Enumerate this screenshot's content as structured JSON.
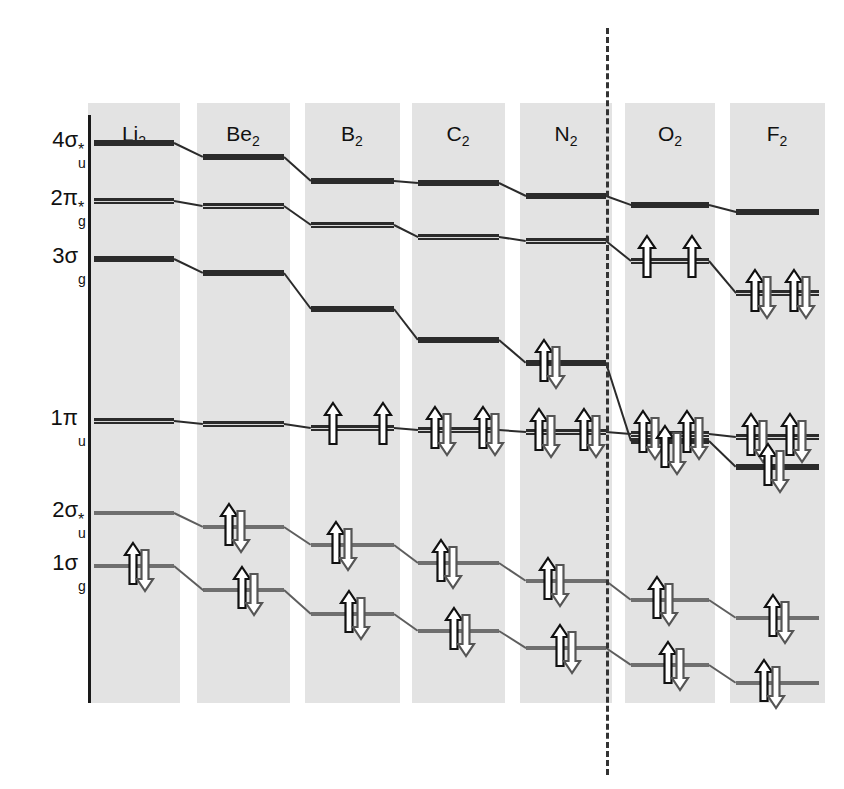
{
  "figure": {
    "type": "molecular-orbital-correlation-diagram",
    "title": "",
    "background_band_color": "#e3e3e3",
    "line_color": "#2b2b2b",
    "divider": {
      "kind": "dashed-vertical",
      "x": 606,
      "note": "separates N2 from O2 where 3-sigma-g and 1-pi-u orbital ordering inverts"
    }
  },
  "axis": {
    "orbital_labels": [
      {
        "id": "4su",
        "base": "4σ",
        "star": "*",
        "sub": "u",
        "y": 143
      },
      {
        "id": "2pg",
        "base": "2π",
        "star": "*",
        "sub": "g",
        "y": 201
      },
      {
        "id": "3sg",
        "base": "3σ",
        "star": "",
        "sub": "g",
        "y": 259
      },
      {
        "id": "1pu",
        "base": "1π",
        "star": "",
        "sub": "u",
        "y": 421
      },
      {
        "id": "2su",
        "base": "2σ",
        "star": "*",
        "sub": "u",
        "y": 513
      },
      {
        "id": "1sg",
        "base": "1σ",
        "star": "",
        "sub": "g",
        "y": 566
      }
    ]
  },
  "columns": [
    {
      "id": "Li2",
      "element": "Li",
      "count": "2",
      "x": 88,
      "width": 92,
      "center": 134
    },
    {
      "id": "Be2",
      "element": "Be",
      "count": "2",
      "x": 197,
      "width": 93,
      "center": 243
    },
    {
      "id": "B2",
      "element": "B",
      "count": "2",
      "x": 305,
      "width": 95,
      "center": 352
    },
    {
      "id": "C2",
      "element": "C",
      "count": "2",
      "x": 412,
      "width": 93,
      "center": 458
    },
    {
      "id": "N2",
      "element": "N",
      "count": "2",
      "x": 520,
      "width": 92,
      "center": 566
    },
    {
      "id": "O2",
      "element": "O",
      "count": "2",
      "x": 625,
      "width": 90,
      "center": 670
    },
    {
      "id": "F2",
      "element": "F",
      "count": "2",
      "x": 730,
      "width": 95,
      "center": 777
    }
  ],
  "header_y": 122,
  "chart_data": {
    "type": "line",
    "xlabel": "",
    "ylabel": "Orbital energy (increasing upward)",
    "categories": [
      "Li2",
      "Be2",
      "B2",
      "C2",
      "N2",
      "O2",
      "F2"
    ],
    "grid": false,
    "legend": "none",
    "note": "y values are screen pixel rows (smaller = higher energy); electrons given as arrow counts per degenerate component",
    "series": [
      {
        "name": "4σ*u",
        "style": "thick",
        "values": [
          143,
          157,
          181,
          183,
          196,
          205,
          212
        ]
      },
      {
        "name": "2π*g",
        "style": "double",
        "values": [
          201,
          206,
          225,
          237,
          241,
          261,
          293
        ]
      },
      {
        "name": "3σg",
        "style": "thick",
        "values": [
          259,
          273,
          309,
          340,
          363,
          441,
          467
        ]
      },
      {
        "name": "1πu",
        "style": "double",
        "values": [
          421,
          424,
          428,
          430,
          432,
          434,
          437
        ]
      },
      {
        "name": "2σ*u",
        "style": "thin",
        "values": [
          513,
          527,
          545,
          563,
          581,
          600,
          618
        ]
      },
      {
        "name": "1σg",
        "style": "thin",
        "values": [
          566,
          590,
          614,
          631,
          648,
          665,
          683
        ]
      }
    ],
    "electron_occupancy": {
      "Li2": {
        "1σg": 2,
        "2σ*u": 0,
        "1πu": 0,
        "3σg": 0,
        "2π*g": 0,
        "4σ*u": 0
      },
      "Be2": {
        "1σg": 2,
        "2σ*u": 2,
        "1πu": 0,
        "3σg": 0,
        "2π*g": 0,
        "4σ*u": 0
      },
      "B2": {
        "1σg": 2,
        "2σ*u": 2,
        "1πu": 2,
        "3σg": 0,
        "2π*g": 0,
        "4σ*u": 0
      },
      "C2": {
        "1σg": 2,
        "2σ*u": 2,
        "1πu": 4,
        "3σg": 0,
        "2π*g": 0,
        "4σ*u": 0
      },
      "N2": {
        "1σg": 2,
        "2σ*u": 2,
        "1πu": 4,
        "3σg": 2,
        "2π*g": 0,
        "4σ*u": 0
      },
      "O2": {
        "1σg": 2,
        "2σ*u": 2,
        "3σg": 2,
        "1πu": 4,
        "2π*g": 2,
        "4σ*u": 0
      },
      "F2": {
        "1σg": 2,
        "2σ*u": 2,
        "3σg": 2,
        "1πu": 4,
        "2π*g": 4,
        "4σ*u": 0
      }
    }
  },
  "electrons": [
    {
      "col": "Li2",
      "orbital": "1σg",
      "x": 122,
      "y": 566,
      "kind": "pair"
    },
    {
      "col": "Be2",
      "orbital": "2σ*u",
      "x": 218,
      "y": 527,
      "kind": "pair"
    },
    {
      "col": "Be2",
      "orbital": "1σg",
      "x": 231,
      "y": 590,
      "kind": "pair"
    },
    {
      "col": "B2",
      "orbital": "1πu",
      "x": 322,
      "y": 428,
      "kind": "up"
    },
    {
      "col": "B2",
      "orbital": "1πu",
      "x": 372,
      "y": 428,
      "kind": "up"
    },
    {
      "col": "B2",
      "orbital": "2σ*u",
      "x": 325,
      "y": 545,
      "kind": "pair"
    },
    {
      "col": "B2",
      "orbital": "1σg",
      "x": 338,
      "y": 614,
      "kind": "pair"
    },
    {
      "col": "C2",
      "orbital": "1πu",
      "x": 424,
      "y": 430,
      "kind": "pair"
    },
    {
      "col": "C2",
      "orbital": "1πu",
      "x": 472,
      "y": 430,
      "kind": "pair"
    },
    {
      "col": "C2",
      "orbital": "2σ*u",
      "x": 430,
      "y": 563,
      "kind": "pair"
    },
    {
      "col": "C2",
      "orbital": "1σg",
      "x": 443,
      "y": 631,
      "kind": "pair"
    },
    {
      "col": "N2",
      "orbital": "3σg",
      "x": 533,
      "y": 363,
      "kind": "pair"
    },
    {
      "col": "N2",
      "orbital": "1πu",
      "x": 528,
      "y": 432,
      "kind": "pair"
    },
    {
      "col": "N2",
      "orbital": "1πu",
      "x": 573,
      "y": 432,
      "kind": "pair"
    },
    {
      "col": "N2",
      "orbital": "2σ*u",
      "x": 537,
      "y": 581,
      "kind": "pair"
    },
    {
      "col": "N2",
      "orbital": "1σg",
      "x": 549,
      "y": 648,
      "kind": "pair"
    },
    {
      "col": "O2",
      "orbital": "2π*g",
      "x": 636,
      "y": 261,
      "kind": "up"
    },
    {
      "col": "O2",
      "orbital": "2π*g",
      "x": 681,
      "y": 261,
      "kind": "up"
    },
    {
      "col": "O2",
      "orbital": "1πu",
      "x": 632,
      "y": 434,
      "kind": "pair"
    },
    {
      "col": "O2",
      "orbital": "1πu",
      "x": 676,
      "y": 434,
      "kind": "pair"
    },
    {
      "col": "O2",
      "orbital": "3σg",
      "x": 654,
      "y": 449,
      "kind": "pair"
    },
    {
      "col": "O2",
      "orbital": "2σ*u",
      "x": 646,
      "y": 600,
      "kind": "pair"
    },
    {
      "col": "O2",
      "orbital": "1σg",
      "x": 657,
      "y": 665,
      "kind": "pair"
    },
    {
      "col": "F2",
      "orbital": "2π*g",
      "x": 744,
      "y": 293,
      "kind": "pair"
    },
    {
      "col": "F2",
      "orbital": "2π*g",
      "x": 783,
      "y": 293,
      "kind": "pair"
    },
    {
      "col": "F2",
      "orbital": "1πu",
      "x": 740,
      "y": 437,
      "kind": "pair"
    },
    {
      "col": "F2",
      "orbital": "1πu",
      "x": 779,
      "y": 437,
      "kind": "pair"
    },
    {
      "col": "F2",
      "orbital": "3σg",
      "x": 757,
      "y": 467,
      "kind": "pair"
    },
    {
      "col": "F2",
      "orbital": "2σ*u",
      "x": 762,
      "y": 618,
      "kind": "pair"
    },
    {
      "col": "F2",
      "orbital": "1σg",
      "x": 753,
      "y": 683,
      "kind": "pair"
    }
  ]
}
